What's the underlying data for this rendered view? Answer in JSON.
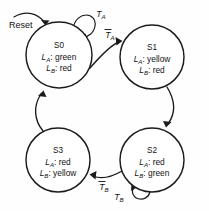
{
  "diagram": {
    "type": "finite-state-machine",
    "reset": {
      "label": "Reset",
      "target": "S0"
    },
    "states": [
      {
        "id": "S0",
        "name": "S0",
        "position": "top-left",
        "cx": 59,
        "cy": 55,
        "r": 33,
        "outputs": [
          {
            "signal": "L",
            "subscript": "A",
            "separator": ":",
            "value": "green"
          },
          {
            "signal": "L",
            "subscript": "B",
            "separator": ":",
            "value": "red"
          }
        ]
      },
      {
        "id": "S1",
        "name": "S1",
        "position": "top-right",
        "cx": 152,
        "cy": 57,
        "r": 32,
        "outputs": [
          {
            "signal": "L",
            "subscript": "A",
            "separator": ":",
            "value": "yellow"
          },
          {
            "signal": "L",
            "subscript": "B",
            "separator": ":",
            "value": "red"
          }
        ]
      },
      {
        "id": "S2",
        "name": "S2",
        "position": "bottom-right",
        "cx": 152,
        "cy": 160,
        "r": 32,
        "outputs": [
          {
            "signal": "L",
            "subscript": "A",
            "separator": ":",
            "value": "red"
          },
          {
            "signal": "L",
            "subscript": "B",
            "separator": ":",
            "value": "green"
          }
        ]
      },
      {
        "id": "S3",
        "name": "S3",
        "position": "bottom-left",
        "cx": 58,
        "cy": 160,
        "r": 32,
        "outputs": [
          {
            "signal": "L",
            "subscript": "A",
            "separator": ":",
            "value": "red"
          },
          {
            "signal": "L",
            "subscript": "B",
            "separator": ":",
            "value": "yellow"
          }
        ]
      }
    ],
    "transitions": [
      {
        "id": "t-s0-self",
        "from": "S0",
        "to": "S0",
        "kind": "self-loop",
        "label": {
          "signal": "T",
          "subscript": "A",
          "negated": false
        }
      },
      {
        "id": "t-s0-s1",
        "from": "S0",
        "to": "S1",
        "kind": "arc",
        "label": {
          "signal": "T",
          "subscript": "A",
          "negated": true
        }
      },
      {
        "id": "t-s1-s2",
        "from": "S1",
        "to": "S2",
        "kind": "arc",
        "label": null
      },
      {
        "id": "t-s2-self",
        "from": "S2",
        "to": "S2",
        "kind": "self-loop",
        "label": {
          "signal": "T",
          "subscript": "B",
          "negated": false
        }
      },
      {
        "id": "t-s2-s3",
        "from": "S2",
        "to": "S3",
        "kind": "arc",
        "label": {
          "signal": "T",
          "subscript": "B",
          "negated": true
        }
      },
      {
        "id": "t-s3-s0",
        "from": "S3",
        "to": "S0",
        "kind": "arc",
        "label": null
      }
    ],
    "colors": {
      "ink": "#1b1b1b",
      "text": "#121212",
      "background": "#fefefe",
      "state_fill": "#ffffff"
    }
  }
}
